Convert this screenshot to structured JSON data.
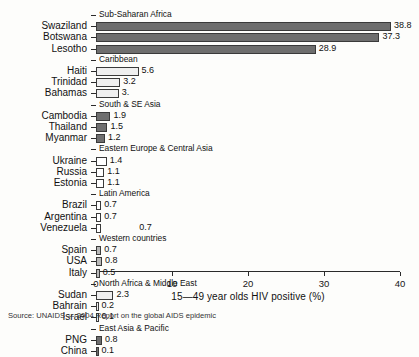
{
  "chart_data": {
    "type": "bar",
    "orientation": "horizontal",
    "title": "",
    "xlabel": "15—49 year olds HIV positive (%)",
    "ylabel": "",
    "xlim": [
      0,
      40
    ],
    "xticks": [
      0,
      10,
      20,
      30,
      40
    ],
    "grid": false,
    "legend": false,
    "source": "Source: UNAIDS — 2004 Report on the global AIDS epidemic",
    "groups": [
      {
        "name": "Sub-Saharan Africa",
        "fill": "dark",
        "categories": [
          "Swaziland",
          "Botswana",
          "Lesotho"
        ],
        "values": [
          38.8,
          37.3,
          28.9
        ],
        "labels": [
          "38.8",
          "37.3",
          "28.9"
        ]
      },
      {
        "name": "Caribbean",
        "fill": "light",
        "categories": [
          "Haiti",
          "Trinidad",
          "Bahamas"
        ],
        "values": [
          5.6,
          3.2,
          3.0
        ],
        "labels": [
          "5.6",
          "3.2",
          "3."
        ]
      },
      {
        "name": "South & SE Asia",
        "fill": "dark",
        "categories": [
          "Cambodia",
          "Thailand",
          "Myanmar"
        ],
        "values": [
          1.9,
          1.5,
          1.2
        ],
        "labels": [
          "1.9",
          "1.5",
          "1.2"
        ]
      },
      {
        "name": "Eastern Europe & Central Asia",
        "fill": "hollow",
        "categories": [
          "Ukraine",
          "Russia",
          "Estonia"
        ],
        "values": [
          1.4,
          1.1,
          1.1
        ],
        "labels": [
          "1.4",
          "1.1",
          "1.1"
        ]
      },
      {
        "name": "Latin America",
        "fill": "hollow",
        "categories": [
          "Brazil",
          "Argentina",
          "Venezuela"
        ],
        "values": [
          0.7,
          0.7,
          0.7
        ],
        "labels": [
          "0.7",
          "0.7",
          "0.7"
        ]
      },
      {
        "name": "Western countries",
        "fill": "mid",
        "categories": [
          "Spain",
          "USA",
          "Italy"
        ],
        "values": [
          0.7,
          0.8,
          0.5
        ],
        "labels": [
          "0.7",
          "0.8",
          "0.5"
        ]
      },
      {
        "name": "North Africa & Middle East",
        "fill": "light",
        "categories": [
          "Sudan",
          "Bahrain",
          "Israel"
        ],
        "values": [
          2.3,
          0.2,
          0.1
        ],
        "labels": [
          "2.3",
          "0.2",
          "0.1"
        ]
      },
      {
        "name": "East Asia & Pacific",
        "fill": "dark",
        "categories": [
          "PNG",
          "China"
        ],
        "values": [
          0.8,
          0.1
        ],
        "labels": [
          "0.8",
          "0.1"
        ]
      }
    ]
  }
}
